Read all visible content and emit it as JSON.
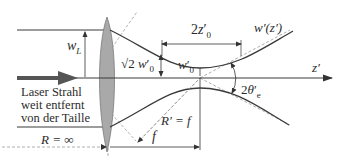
{
  "diagram": {
    "labels": {
      "w_L": "w",
      "w_L_sub": "L",
      "sqrt2": "√2",
      "sqrt2_w": "w",
      "sqrt2_w_prime": "′",
      "sqrt2_w_sub": "0",
      "waist_w": "w",
      "waist_w_prime": "′",
      "waist_w_sub": "0",
      "rayleigh": "2z",
      "rayleigh_prime": "′",
      "rayleigh_sub": "0",
      "beam_func": "w′(z′)",
      "axis": "z′",
      "angle": "2θ",
      "angle_prime": "′",
      "angle_sub": "e",
      "radius_out": "R′ = f",
      "focal": "f",
      "radius_in": "R = ∞"
    },
    "caption_lines": [
      "Laser Strahl",
      "weit entfernt",
      "von der Taille"
    ],
    "colors": {
      "line": "#3a3a3a",
      "dashed": "#9a9a9a",
      "lens_fill": "#a9a9a9",
      "lens_stroke": "#7a7a7a",
      "arrow": "#555555"
    }
  }
}
